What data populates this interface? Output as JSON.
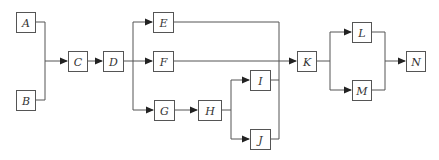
{
  "diagram": {
    "type": "flow-network",
    "colors": {
      "line": "#555555",
      "box_fill": "#ffffff",
      "text": "#333333"
    },
    "nodes": [
      {
        "id": "A",
        "label": "A",
        "x": 16,
        "y": 12,
        "w": 19,
        "h": 20
      },
      {
        "id": "B",
        "label": "B",
        "x": 16,
        "y": 90,
        "w": 19,
        "h": 20
      },
      {
        "id": "C",
        "label": "C",
        "x": 68,
        "y": 51,
        "w": 19,
        "h": 20
      },
      {
        "id": "D",
        "label": "D",
        "x": 103,
        "y": 51,
        "w": 20,
        "h": 20
      },
      {
        "id": "E",
        "label": "E",
        "x": 153,
        "y": 12,
        "w": 20,
        "h": 20
      },
      {
        "id": "F",
        "label": "F",
        "x": 153,
        "y": 51,
        "w": 20,
        "h": 20
      },
      {
        "id": "G",
        "label": "G",
        "x": 154,
        "y": 100,
        "w": 20,
        "h": 20
      },
      {
        "id": "H",
        "label": "H",
        "x": 198,
        "y": 100,
        "w": 23,
        "h": 20
      },
      {
        "id": "I",
        "label": "I",
        "x": 250,
        "y": 70,
        "w": 20,
        "h": 20
      },
      {
        "id": "J",
        "label": "J",
        "x": 250,
        "y": 129,
        "w": 20,
        "h": 20
      },
      {
        "id": "K",
        "label": "K",
        "x": 297,
        "y": 51,
        "w": 19,
        "h": 20
      },
      {
        "id": "L",
        "label": "L",
        "x": 352,
        "y": 22,
        "w": 19,
        "h": 20
      },
      {
        "id": "M",
        "label": "M",
        "x": 352,
        "y": 80,
        "w": 19,
        "h": 20
      },
      {
        "id": "N",
        "label": "N",
        "x": 406,
        "y": 51,
        "w": 19,
        "h": 20
      }
    ],
    "edges": [
      {
        "from": "A",
        "to": "C"
      },
      {
        "from": "B",
        "to": "C"
      },
      {
        "from": "C",
        "to": "D"
      },
      {
        "from": "D",
        "to": "E"
      },
      {
        "from": "D",
        "to": "F"
      },
      {
        "from": "D",
        "to": "G"
      },
      {
        "from": "G",
        "to": "H"
      },
      {
        "from": "H",
        "to": "I"
      },
      {
        "from": "H",
        "to": "J"
      },
      {
        "from": "E",
        "to": "K"
      },
      {
        "from": "F",
        "to": "K"
      },
      {
        "from": "I",
        "to": "K"
      },
      {
        "from": "J",
        "to": "K"
      },
      {
        "from": "K",
        "to": "L"
      },
      {
        "from": "K",
        "to": "M"
      },
      {
        "from": "L",
        "to": "N"
      },
      {
        "from": "M",
        "to": "N"
      }
    ]
  }
}
